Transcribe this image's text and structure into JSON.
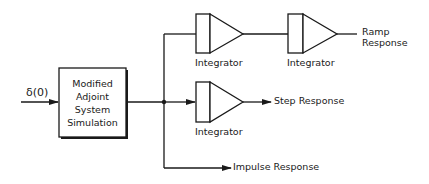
{
  "diagram": {
    "input_label": "δ(0)",
    "main_block": {
      "lines": [
        "Modified",
        "Adjoint",
        "System",
        "Simulation"
      ]
    },
    "integrators": [
      {
        "label": "Integrator",
        "position": "top-first"
      },
      {
        "label": "Integrator",
        "position": "top-second"
      },
      {
        "label": "Integrator",
        "position": "middle"
      }
    ],
    "outputs": {
      "ramp": {
        "line1": "Ramp",
        "line2": "Response"
      },
      "step": "Step Response",
      "impulse": "Impulse Response"
    },
    "colors": {
      "stroke": "#1a1a1a",
      "background": "#ffffff"
    }
  }
}
